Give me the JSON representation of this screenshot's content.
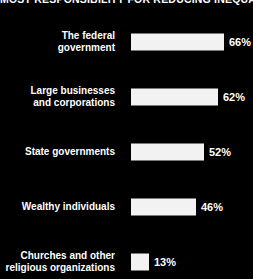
{
  "chart_data": {
    "type": "bar",
    "title": "MOST RESPONSIBILITY FOR REDUCING INEQUALITY",
    "orientation": "horizontal",
    "xlabel": "",
    "ylabel": "",
    "xlim": [
      0,
      87
    ],
    "grid": false,
    "legend": null,
    "value_suffix": "%",
    "categories": [
      "The federal government",
      "Large businesses and corporations",
      "State governments",
      "Wealthy individuals",
      "Churches and other religious organizations"
    ],
    "values": [
      66,
      62,
      52,
      46,
      13
    ],
    "bars": [
      {
        "label_line1": "The federal",
        "label_line2": "government",
        "value": 66,
        "value_label": "66%"
      },
      {
        "label_line1": "Large businesses",
        "label_line2": "and corporations",
        "value": 62,
        "value_label": "62%"
      },
      {
        "label_line1": "State governments",
        "label_line2": "",
        "value": 52,
        "value_label": "52%"
      },
      {
        "label_line1": "Wealthy individuals",
        "label_line2": "",
        "value": 46,
        "value_label": "46%"
      },
      {
        "label_line1": "Churches and other",
        "label_line2": "religious organizations",
        "value": 13,
        "value_label": "13%"
      }
    ]
  },
  "colors": {
    "background": "#000000",
    "bar": "#f2f2f2",
    "text": "#ffffff"
  }
}
